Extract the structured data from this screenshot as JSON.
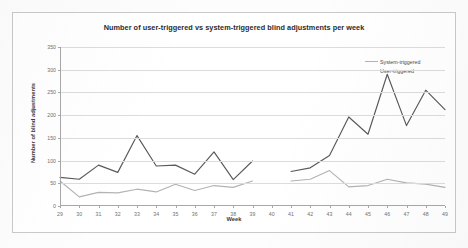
{
  "chart_data": {
    "type": "line",
    "title": "Number of user-triggered vs system-triggered blind adjustments per week",
    "xlabel": "Week",
    "ylabel": "Number of blind adjustments",
    "xlim": [
      29,
      49
    ],
    "ylim": [
      0,
      350
    ],
    "ytick_labels": [
      "0",
      "50",
      "100",
      "150",
      "200",
      "250",
      "300",
      "350"
    ],
    "yticks": [
      0,
      50,
      100,
      150,
      200,
      250,
      300,
      350
    ],
    "categories": [
      29,
      30,
      31,
      32,
      33,
      34,
      35,
      36,
      37,
      38,
      39,
      40,
      41,
      42,
      43,
      44,
      45,
      46,
      47,
      48,
      49
    ],
    "xtick_labels": [
      "29",
      "30",
      "31",
      "32",
      "33",
      "34",
      "35",
      "36",
      "37",
      "38",
      "39",
      "40",
      "41",
      "42",
      "43",
      "44",
      "45",
      "46",
      "47",
      "48",
      "49"
    ],
    "grid": "horizontal",
    "legend_position": "top-right",
    "gap_at": [
      40
    ],
    "series": [
      {
        "name": "System-triggered",
        "color": "#b3b3b3",
        "values": [
          55,
          20,
          30,
          29,
          37,
          31,
          48,
          34,
          45,
          41,
          55,
          null,
          55,
          59,
          78,
          42,
          45,
          59,
          51,
          48,
          41
        ]
      },
      {
        "name": "User-triggered",
        "color": "#595959",
        "values": [
          63,
          59,
          90,
          74,
          155,
          88,
          90,
          70,
          119,
          58,
          99,
          null,
          76,
          84,
          111,
          196,
          158,
          290,
          177,
          255,
          212
        ]
      }
    ]
  },
  "legend": {
    "items": [
      {
        "label": "System-triggered"
      },
      {
        "label": "User-triggered"
      }
    ]
  }
}
